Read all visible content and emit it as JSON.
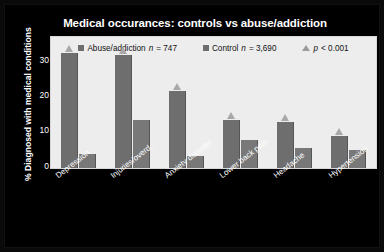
{
  "chart_data": {
    "type": "bar",
    "title": "Medical occurances: controls vs abuse/addiction",
    "xlabel": "",
    "ylabel": "% Diagnosed with medical conditions",
    "ylim": [
      0,
      33
    ],
    "yticks": [
      0,
      10,
      20,
      30
    ],
    "grid": false,
    "legend_position": "top-center",
    "categories": [
      "Depression",
      "Injuries/overd...",
      "Anxiety disorder",
      "Lower back pain",
      "Headache",
      "Hypertension"
    ],
    "series": [
      {
        "name": "Abuse/addiction n = 747",
        "short_name": "Abuse/addiction",
        "n": "747",
        "color": "#6e6e6e",
        "values": [
          28.5,
          28.0,
          19.0,
          12.0,
          11.5,
          8.0
        ],
        "significant": [
          true,
          true,
          true,
          true,
          true,
          true
        ]
      },
      {
        "name": "Control n = 3,690",
        "short_name": "Control",
        "n": "3,690",
        "color": "#787878",
        "values": [
          3.5,
          12.0,
          3.0,
          7.0,
          5.0,
          4.5
        ],
        "significant": [
          false,
          false,
          false,
          false,
          false,
          false
        ]
      }
    ],
    "annotations": {
      "significance_marker": "p < 0.001",
      "marker_symbol": "triangle"
    }
  },
  "legend": {
    "items": [
      {
        "icon": "square-swatch",
        "label_a": "Abuse/addiction ",
        "label_n": "n",
        "label_b": " = 747"
      },
      {
        "icon": "square-swatch",
        "label_a": "Control ",
        "label_n": "n",
        "label_b": " = 3,690"
      },
      {
        "icon": "triangle-marker",
        "label_a": "",
        "label_n": "p",
        "label_b": " < 0.001"
      }
    ]
  }
}
